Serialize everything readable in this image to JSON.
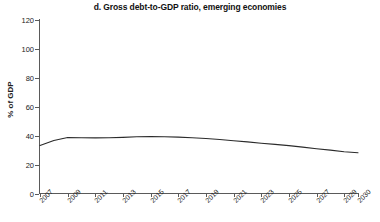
{
  "chart_data": {
    "type": "line",
    "title": "d. Gross debt-to-GDP ratio, emerging economies",
    "xlabel": "",
    "ylabel": "% of GDP",
    "ylim": [
      0,
      120
    ],
    "yticks": [
      0,
      20,
      40,
      60,
      80,
      100,
      120
    ],
    "xlim": [
      2007,
      2030
    ],
    "xticks": [
      2007,
      2009,
      2011,
      2013,
      2015,
      2017,
      2019,
      2021,
      2023,
      2025,
      2027,
      2029,
      2030
    ],
    "xtick_labels": [
      "2007",
      "2009",
      "2011",
      "2013",
      "2015",
      "2017",
      "2019",
      "2021",
      "2023",
      "2025",
      "2027",
      "2029",
      "2030"
    ],
    "grid": false,
    "legend": false,
    "line_color": "#2b2b2b",
    "x": [
      2007,
      2008,
      2009,
      2010,
      2011,
      2012,
      2013,
      2014,
      2015,
      2016,
      2017,
      2018,
      2019,
      2020,
      2021,
      2022,
      2023,
      2024,
      2025,
      2026,
      2027,
      2028,
      2029,
      2030
    ],
    "series": [
      {
        "name": "Gross debt-to-GDP ratio, emerging economies",
        "values": [
          33.2,
          36.6,
          38.7,
          38.6,
          38.5,
          38.6,
          38.8,
          39.2,
          39.4,
          39.3,
          39.0,
          38.6,
          38.0,
          37.3,
          36.5,
          35.7,
          34.8,
          34.0,
          33.1,
          32.1,
          31.0,
          30.0,
          28.9,
          28.2
        ]
      }
    ]
  },
  "axes": {
    "y_ticks": [
      "120",
      "100",
      "80",
      "60",
      "40",
      "20",
      "0"
    ],
    "y_title": "% of GDP",
    "x_ticks": [
      "2007",
      "2009",
      "2011",
      "2013",
      "2015",
      "2017",
      "2019",
      "2021",
      "2023",
      "2025",
      "2027",
      "2029",
      "2030"
    ]
  },
  "header": {
    "title": "d. Gross debt-to-GDP ratio, emerging economies"
  }
}
